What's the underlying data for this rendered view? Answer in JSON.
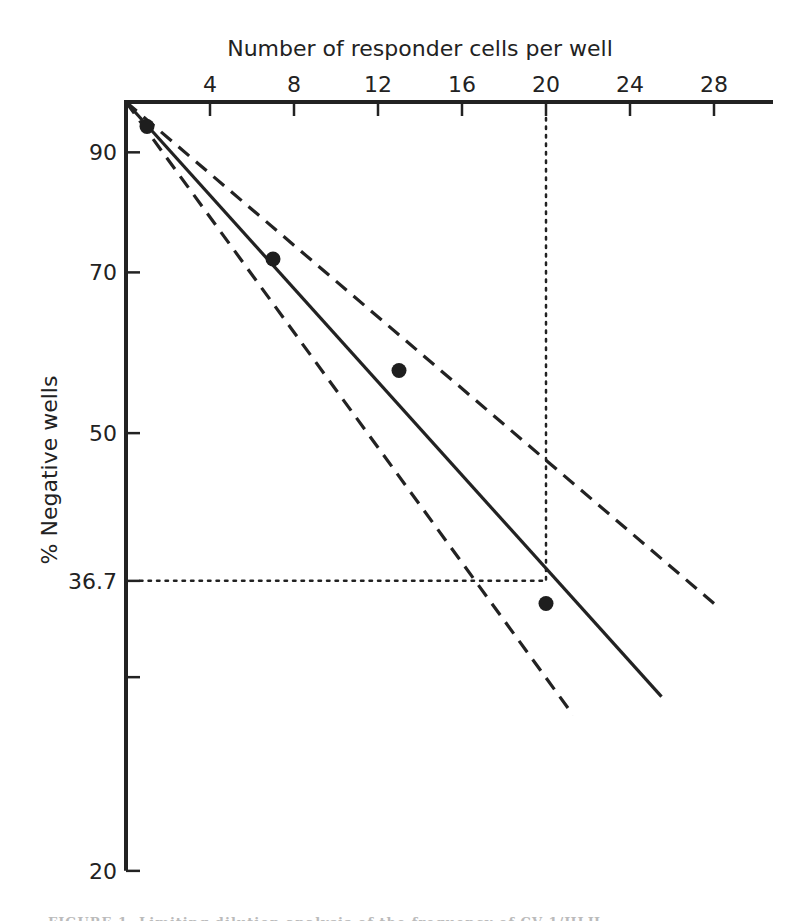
{
  "chart_data": {
    "type": "line",
    "title": "",
    "xlabel": "Number of responder cells per well",
    "ylabel": "% Negative wells",
    "x_axis_position": "top",
    "xlim": [
      0,
      30
    ],
    "x_ticks": [
      4,
      8,
      12,
      16,
      20,
      24,
      28
    ],
    "y_scale": "log",
    "ylim": [
      20,
      100
    ],
    "y_ticks": [
      {
        "value": 90,
        "label": "90"
      },
      {
        "value": 70,
        "label": "70"
      },
      {
        "value": 50,
        "label": "50"
      },
      {
        "value": 36.7,
        "label": "36.7"
      },
      {
        "value": 30,
        "label": ""
      },
      {
        "value": 20,
        "label": "20"
      }
    ],
    "grid": false,
    "points": {
      "name": "Observed",
      "marker": "filled-circle",
      "x": [
        1,
        7,
        13,
        20
      ],
      "y": [
        95,
        72,
        57,
        35
      ]
    },
    "series": [
      {
        "name": "Fitted regression",
        "style": "solid",
        "x": [
          0,
          25.5
        ],
        "y": [
          100,
          28.8
        ]
      },
      {
        "name": "Upper 95% confidence limit",
        "style": "dashed",
        "x": [
          0,
          28
        ],
        "y": [
          100,
          35
        ]
      },
      {
        "name": "Lower 95% confidence limit",
        "style": "dashed",
        "x": [
          0,
          21.3
        ],
        "y": [
          100,
          27.7
        ]
      }
    ],
    "annotations": [
      {
        "type": "reference-line",
        "style": "dotted",
        "orientation": "horizontal",
        "y": 36.7,
        "x_range": [
          0,
          20
        ]
      },
      {
        "type": "reference-line",
        "style": "dotted",
        "orientation": "vertical",
        "x": 20,
        "y_range": [
          36.7,
          100
        ]
      }
    ]
  },
  "labels": {
    "x_title": "Number of responder cells per well",
    "y_title": "% Negative wells"
  },
  "caption": "FIGURE 1. Limiting dilution analysis of the frequency of CV-1/HLH"
}
